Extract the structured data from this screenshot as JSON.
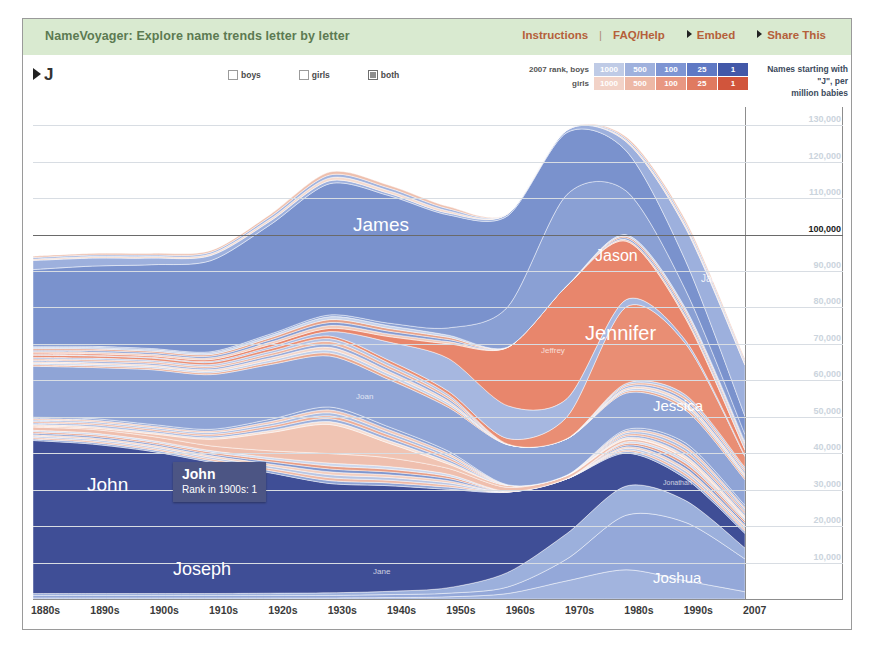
{
  "header": {
    "title": "NameVoyager: Explore name trends letter by letter",
    "links": [
      {
        "label": "Instructions",
        "arrow": false
      },
      {
        "label": "FAQ/Help",
        "arrow": false
      },
      {
        "label": "Embed",
        "arrow": true
      },
      {
        "label": "Share This",
        "arrow": true
      }
    ],
    "separator": "|"
  },
  "controls": {
    "search_value": "J",
    "search_prefix": "›",
    "sex_options": [
      {
        "label": "boys",
        "checked": false
      },
      {
        "label": "girls",
        "checked": false
      },
      {
        "label": "both",
        "checked": true
      }
    ]
  },
  "rank_legend": {
    "boys_label": "2007 rank, boys",
    "girls_label": "girls",
    "ranks": [
      "1000",
      "500",
      "100",
      "25",
      "1"
    ],
    "boys_colors": [
      "#bfcbe6",
      "#9fb1dd",
      "#7e95d3",
      "#5f79c4",
      "#4258a8"
    ],
    "girls_colors": [
      "#f2d2c7",
      "#edb8a6",
      "#e89782",
      "#e07a60",
      "#d1553c"
    ]
  },
  "right_caption": {
    "line1": "Names starting with",
    "line2": "\"J\", per",
    "line3": "million babies"
  },
  "tooltip": {
    "name": "John",
    "rank_text": "Rank in 1900s: 1",
    "bg": "#4c5584"
  },
  "chart_data": {
    "type": "area",
    "title": "Names starting with \"J\", per million babies",
    "xlabel": "",
    "ylabel": "Names starting with \"J\", per million babies",
    "x": [
      "1880s",
      "1890s",
      "1900s",
      "1910s",
      "1920s",
      "1930s",
      "1940s",
      "1950s",
      "1960s",
      "1970s",
      "1980s",
      "1990s",
      "2007"
    ],
    "xlim": [
      "1880s",
      "2007"
    ],
    "ylim": [
      0,
      135000
    ],
    "yticks": [
      10000,
      20000,
      30000,
      40000,
      50000,
      60000,
      70000,
      80000,
      90000,
      100000,
      110000,
      120000,
      130000
    ],
    "ytick_labels": [
      "10,000",
      "20,000",
      "30,000",
      "40,000",
      "50,000",
      "60,000",
      "70,000",
      "80,000",
      "90,000",
      "100,000",
      "110,000",
      "120,000",
      "130,000"
    ],
    "highlight_ytick": "100,000",
    "grid": true,
    "legend": "none",
    "total_values": [
      97000,
      98000,
      98000,
      99000,
      110000,
      123000,
      119000,
      112000,
      106000,
      128000,
      130000,
      109000,
      70000
    ],
    "series": [
      {
        "name": "John",
        "sex": "boys",
        "color": "#3f4e96",
        "values": [
          42000,
          41000,
          39000,
          36000,
          33000,
          30000,
          29000,
          27000,
          22000,
          15000,
          9000,
          6000,
          4000
        ],
        "label_x": 54,
        "label_y": 455,
        "label_size": 19
      },
      {
        "name": "Joseph",
        "sex": "boys",
        "color": "#8fa4d6",
        "values": [
          14000,
          14000,
          15000,
          15000,
          15000,
          14000,
          13000,
          12000,
          11000,
          10000,
          10000,
          9000,
          7000
        ],
        "label_x": 140,
        "label_y": 540,
        "label_size": 18
      },
      {
        "name": "James",
        "sex": "boys",
        "color": "#7a92cd",
        "values": [
          21000,
          22000,
          23000,
          25000,
          30000,
          36000,
          35000,
          31000,
          25000,
          17000,
          11000,
          8000,
          5000
        ],
        "label_x": 320,
        "label_y": 195,
        "label_size": 19
      },
      {
        "name": "Jason",
        "sex": "boys",
        "color": "#8aa0d4",
        "values": [
          300,
          300,
          300,
          300,
          400,
          500,
          700,
          2000,
          11000,
          25000,
          12000,
          5000,
          2000
        ],
        "label_x": 562,
        "label_y": 228,
        "label_size": 16
      },
      {
        "name": "Jennifer",
        "sex": "girls",
        "color": "#e8866c",
        "values": [
          400,
          400,
          400,
          500,
          700,
          900,
          1500,
          4000,
          16000,
          31000,
          16000,
          6000,
          1500
        ],
        "label_x": 552,
        "label_y": 303,
        "label_size": 20
      },
      {
        "name": "Jessica",
        "sex": "girls",
        "color": "#e98e74",
        "values": [
          600,
          600,
          600,
          600,
          700,
          700,
          800,
          900,
          1500,
          6000,
          21000,
          14000,
          3000
        ],
        "label_x": 620,
        "label_y": 378,
        "label_size": 15
      },
      {
        "name": "Joshua",
        "sex": "boys",
        "color": "#94a8d9",
        "values": [
          700,
          700,
          700,
          700,
          700,
          700,
          800,
          1000,
          1800,
          6000,
          15000,
          16000,
          9000
        ],
        "label_x": 620,
        "label_y": 550,
        "label_size": 15
      },
      {
        "name": "Jacob",
        "sex": "boys",
        "color": "#9db0dd",
        "values": [
          2500,
          2200,
          1800,
          1400,
          1000,
          800,
          600,
          500,
          500,
          700,
          2500,
          9000,
          14000
        ],
        "label_x": 668,
        "label_y": 254,
        "label_size": 10
      },
      {
        "name": "Jeffrey",
        "sex": "boys",
        "color": "#a6b7e0",
        "values": [
          200,
          200,
          200,
          300,
          500,
          1200,
          5000,
          9000,
          9000,
          5000,
          2000,
          900,
          300
        ],
        "label_x": 508,
        "label_y": 327,
        "label_size": 8
      },
      {
        "name": "Jonathan",
        "sex": "boys",
        "color": "#9cb0dc",
        "values": [
          500,
          500,
          500,
          500,
          600,
          700,
          900,
          1500,
          4000,
          7000,
          8000,
          6000,
          3000
        ],
        "label_x": 630,
        "label_y": 460,
        "label_size": 7
      },
      {
        "name": "Justin",
        "sex": "boys",
        "color": "#a2b4de",
        "values": [
          300,
          300,
          300,
          300,
          300,
          300,
          400,
          600,
          1500,
          5000,
          8000,
          5000,
          2000
        ],
        "label_x": 640,
        "label_y": 592,
        "label_size": 8
      },
      {
        "name": "Joan",
        "sex": "girls",
        "color": "#f0c4b3",
        "values": [
          300,
          400,
          700,
          1800,
          5000,
          8000,
          4000,
          1200,
          500,
          200,
          150,
          100,
          60
        ],
        "label_x": 323,
        "label_y": 373,
        "label_size": 8
      },
      {
        "name": "Jane",
        "sex": "girls",
        "color": "#efbfae",
        "values": [
          900,
          1000,
          1100,
          1300,
          1800,
          2600,
          2400,
          1600,
          1100,
          800,
          600,
          500,
          300
        ],
        "label_x": 340,
        "label_y": 548,
        "label_size": 8
      }
    ]
  },
  "x_ticks": [
    "1880s",
    "1890s",
    "1900s",
    "1910s",
    "1920s",
    "1930s",
    "1940s",
    "1950s",
    "1960s",
    "1970s",
    "1980s",
    "1990s",
    "2007"
  ]
}
